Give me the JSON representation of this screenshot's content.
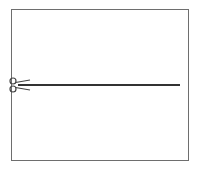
{
  "diagram": {
    "type": "cut-line",
    "frame": {
      "x": 11,
      "y": 9,
      "width": 178,
      "height": 152,
      "stroke": "#6e6e6e"
    },
    "cut_line": {
      "x1": 18,
      "y1": 85,
      "x2": 180,
      "y2": 85,
      "stroke": "#333333",
      "width": 2
    },
    "scissors": {
      "icon": "scissors-icon",
      "x": 13,
      "y": 85,
      "direction": "right"
    }
  }
}
